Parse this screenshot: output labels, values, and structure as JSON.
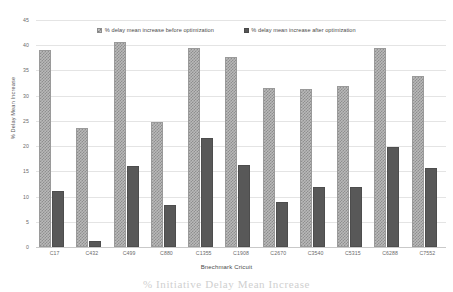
{
  "chart_data": {
    "type": "bar",
    "title": "",
    "xlabel": "Bnechmark Cricuit",
    "ylabel": "% Delay Mean Increase",
    "ylim": [
      0,
      45
    ],
    "ytick_step": 5,
    "yticks": [
      "0",
      "5",
      "10",
      "15",
      "20",
      "25",
      "30",
      "35",
      "40",
      "45"
    ],
    "grid": true,
    "legend_position": "top-center",
    "categories": [
      "C17",
      "C432",
      "C499",
      "C880",
      "C1355",
      "C1908",
      "C2670",
      "C3540",
      "C5315",
      "C6288",
      "C7552"
    ],
    "series": [
      {
        "name": "% delay mean increase before optimization",
        "color": "#b9b9b9",
        "pattern": "checkered",
        "values": [
          39.1,
          23.5,
          40.6,
          24.8,
          39.4,
          37.6,
          31.6,
          31.4,
          31.9,
          39.4,
          34.0
        ]
      },
      {
        "name": "% delay mean increase after optimization",
        "color": "#585858",
        "pattern": "solid",
        "values": [
          11.2,
          1.2,
          16.1,
          8.4,
          21.7,
          16.2,
          8.9,
          11.9,
          11.8,
          19.8,
          15.7
        ]
      }
    ]
  },
  "legend": {
    "items": [
      {
        "label": "% delay mean increase before optimization",
        "swatch": "checkered-swatch-icon"
      },
      {
        "label": "% delay mean increase after optimization",
        "swatch": "solid-swatch-icon"
      }
    ]
  },
  "caption": {
    "text": "% Initiative Delay Mean Increase"
  }
}
